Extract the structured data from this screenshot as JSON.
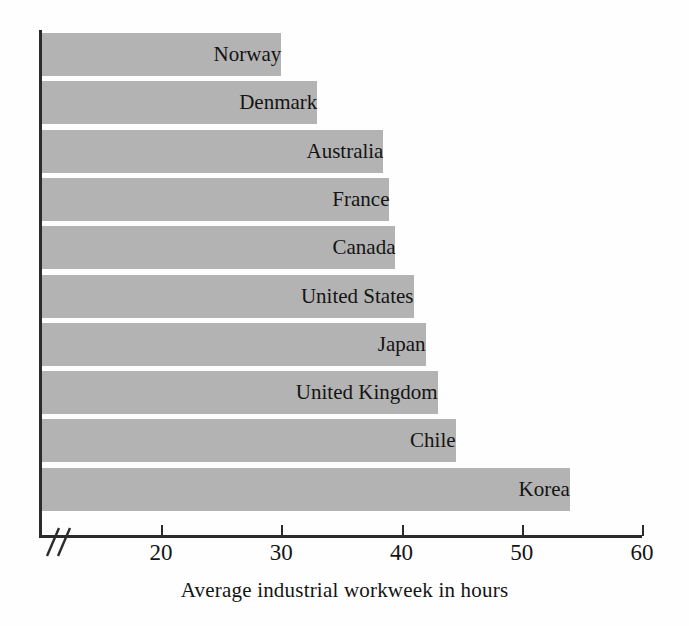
{
  "chart_data": {
    "type": "bar",
    "orientation": "horizontal",
    "title": "",
    "xlabel": "Average industrial workweek in hours",
    "ylabel": "",
    "categories": [
      "Norway",
      "Denmark",
      "Australia",
      "France",
      "Canada",
      "United States",
      "Japan",
      "United Kingdom",
      "Chile",
      "Korea"
    ],
    "values": [
      30,
      33,
      38.5,
      39,
      39.5,
      41,
      42,
      43,
      44.5,
      54
    ],
    "xlim": [
      14,
      60
    ],
    "xticks": [
      20,
      30,
      40,
      50,
      60
    ],
    "xtick_labels": [
      "20",
      "30",
      "40",
      "50",
      "60"
    ],
    "axis_break": true,
    "axis_break_symbol": "//",
    "grid": false,
    "legend": false,
    "bar_color": "#b3b3b3",
    "axis_color": "#2b2b2b",
    "label_color": "#141414"
  },
  "axis": {
    "title": "Average industrial workweek in hours"
  }
}
